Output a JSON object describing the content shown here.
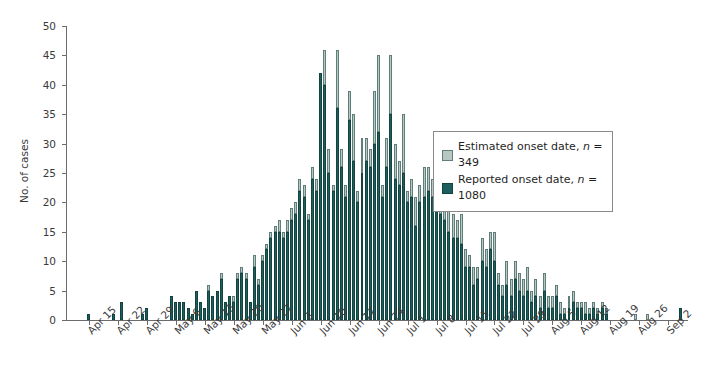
{
  "chart_data": {
    "type": "bar",
    "title": "",
    "subtitle": "",
    "xlabel": "",
    "ylabel": "No. of cases",
    "ylim": [
      0,
      50
    ],
    "ytick_step": 5,
    "yticks": [
      0,
      5,
      10,
      15,
      20,
      25,
      30,
      35,
      40,
      45,
      50
    ],
    "grid": false,
    "stacked": true,
    "legend_position": "upper-right-inside",
    "colors": {
      "estimated": "#b7c8c3",
      "estimated_edge": "#5f7d79",
      "reported": "#1c5f5e",
      "reported_edge": "#13433f",
      "axis": "#6b6b6b",
      "text": "#3a3a3a"
    },
    "x_axis_start": "Apr 10",
    "x_axis_end": "Sep 5",
    "xtick_labels": [
      "Apr 15",
      "Apr 22",
      "Apr 29",
      "May 6",
      "May 13",
      "May 20",
      "May 27",
      "Jun 3",
      "Jun 10",
      "Jun 17",
      "Jun 24",
      "Jul 1",
      "Jul 8",
      "Jul 15",
      "Jul 22",
      "Jul 29",
      "Aug 5",
      "Aug 12",
      "Aug 19",
      "Aug 26",
      "Sep 2"
    ],
    "xtick_indices": [
      5,
      12,
      19,
      26,
      33,
      40,
      47,
      54,
      61,
      68,
      75,
      82,
      89,
      96,
      103,
      110,
      117,
      124,
      131,
      138,
      145
    ],
    "series": [
      {
        "name": "Reported onset date",
        "n": 1080,
        "legend_label": "Reported onset date, n = 1080",
        "values": [
          0,
          0,
          0,
          0,
          0,
          1,
          0,
          0,
          0,
          0,
          0,
          1,
          0,
          3,
          0,
          0,
          0,
          0,
          1,
          2,
          0,
          0,
          0,
          0,
          0,
          4,
          3,
          3,
          3,
          2,
          1,
          5,
          3,
          2,
          5,
          4,
          5,
          7,
          3,
          4,
          3,
          7,
          8,
          7,
          3,
          9,
          6,
          10,
          12,
          14,
          15,
          15,
          14,
          15,
          17,
          18,
          22,
          21,
          17,
          24,
          22,
          42,
          40,
          25,
          22,
          36,
          26,
          21,
          34,
          27,
          20,
          25,
          27,
          26,
          30,
          32,
          21,
          26,
          35,
          24,
          23,
          25,
          20,
          21,
          16,
          20,
          21,
          22,
          21,
          20,
          18,
          17,
          15,
          14,
          14,
          13,
          9,
          9,
          6,
          7,
          10,
          9,
          12,
          10,
          6,
          4,
          6,
          4,
          7,
          5,
          4,
          5,
          3,
          4,
          2,
          5,
          2,
          2,
          4,
          1,
          1,
          2,
          3,
          2,
          2,
          1,
          1,
          2,
          1,
          2,
          1,
          0,
          0,
          0,
          0,
          0,
          0,
          0,
          0,
          0,
          0,
          0,
          0,
          0,
          0,
          0,
          0,
          0,
          2,
          0
        ]
      },
      {
        "name": "Estimated onset date",
        "n": 349,
        "legend_label": "Estimated onset date, n = 349",
        "values": [
          0,
          0,
          0,
          0,
          0,
          0,
          0,
          0,
          0,
          0,
          0,
          0,
          0,
          0,
          0,
          0,
          0,
          0,
          0,
          0,
          0,
          0,
          0,
          0,
          0,
          0,
          0,
          0,
          0,
          0,
          0,
          0,
          0,
          0,
          1,
          0,
          0,
          1,
          0,
          0,
          1,
          1,
          1,
          1,
          0,
          2,
          1,
          1,
          1,
          1,
          1,
          2,
          1,
          2,
          2,
          2,
          2,
          2,
          1,
          2,
          2,
          0,
          6,
          4,
          1,
          10,
          3,
          2,
          5,
          8,
          2,
          6,
          4,
          3,
          9,
          13,
          2,
          5,
          10,
          6,
          4,
          10,
          2,
          3,
          5,
          3,
          5,
          4,
          3,
          4,
          3,
          3,
          4,
          4,
          3,
          5,
          3,
          2,
          3,
          2,
          4,
          3,
          3,
          5,
          2,
          2,
          4,
          3,
          3,
          3,
          3,
          4,
          2,
          3,
          2,
          3,
          2,
          2,
          2,
          2,
          1,
          2,
          2,
          1,
          1,
          2,
          1,
          1,
          1,
          1,
          1,
          0,
          0,
          0,
          0,
          0,
          0,
          1,
          0,
          0,
          1,
          0,
          0,
          0,
          0,
          0,
          0,
          0,
          0,
          0
        ]
      }
    ]
  },
  "legend": {
    "estimated_label": "Estimated onset date, ",
    "estimated_n": "n",
    "estimated_value": " = 349",
    "reported_label": "Reported onset date, ",
    "reported_n": "n",
    "reported_value": " = 1080"
  },
  "axes": {
    "y_title": "No. of cases"
  }
}
